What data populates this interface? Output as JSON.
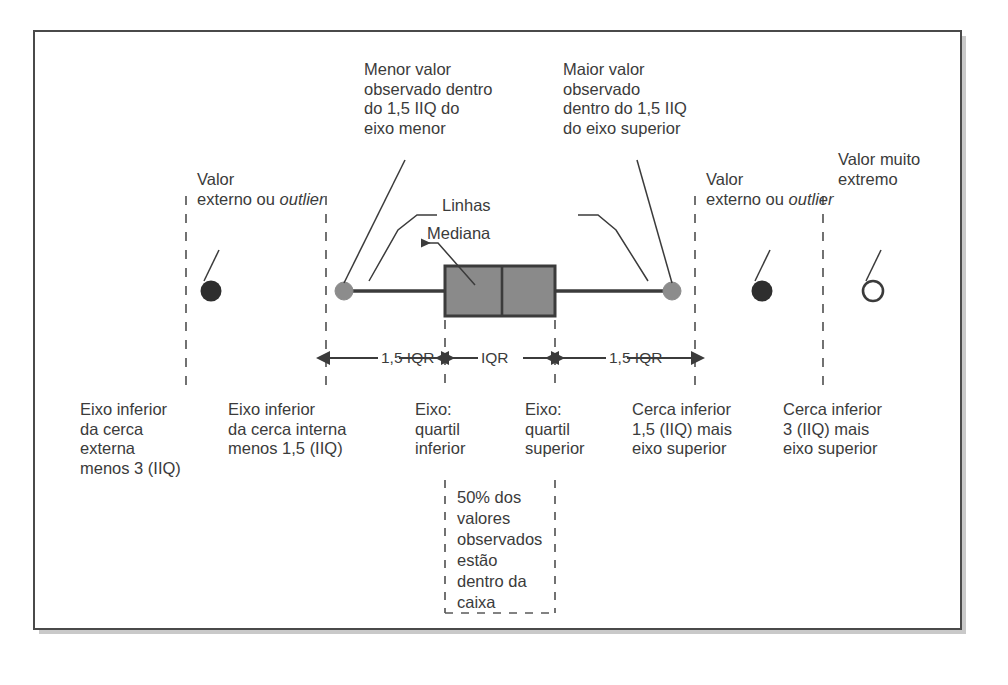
{
  "figure": {
    "type": "boxplot-annotated-diagram",
    "language": "pt-BR",
    "colors": {
      "frame_border": "#4a4a4a",
      "frame_shadow": "#c9c9c9",
      "box_fill": "#8a8a8a",
      "box_stroke": "#3b3b3b",
      "whisker_line": "#3b3b3b",
      "whisker_cap_dot": "#8c8c8c",
      "outlier_fill": "#2e2e2e",
      "extreme_fill": "#ffffff",
      "extreme_stroke": "#3b3b3b",
      "dashed_guide": "#5a5a5a",
      "text": "#3b3b3b"
    }
  },
  "callouts": {
    "lower_whisker": "Menor valor\nobservado dentro\ndo 1,5 IIQ do\neixo menor",
    "upper_whisker": "Maior valor\nobservado\ndentro do 1,5 IIQ\ndo eixo superior",
    "whisker_lines": "Linhas",
    "median": "Mediana",
    "outlier_left": "Valor\nexterno ou\noutlier",
    "outlier_left_plain": "Valor\nexterno ou ",
    "outlier_left_italic": "outlier",
    "outlier_right_plain": "Valor\nexterno ou ",
    "outlier_right_italic": "outlier",
    "extreme_value": "Valor muito\nextremo"
  },
  "dimensions": [
    {
      "id": "left-fence",
      "label": "1,5 IQR"
    },
    {
      "id": "iqr",
      "label": "IQR"
    },
    {
      "id": "right-fence",
      "label": "1,5 IQR"
    }
  ],
  "bottom_labels": [
    {
      "id": "outer-lower-fence",
      "text": "Eixo inferior\nda cerca\nexterna\nmenos 3 (IIQ)"
    },
    {
      "id": "inner-lower-fence",
      "text": "Eixo inferior\nda cerca interna\nmenos 1,5 (IIQ)"
    },
    {
      "id": "lower-quartile",
      "text": "Eixo:\nquartil\ninferior"
    },
    {
      "id": "upper-quartile",
      "text": "Eixo:\nquartil\nsuperior"
    },
    {
      "id": "inner-upper-fence",
      "text": "Cerca inferior\n1,5 (IIQ) mais\neixo superior"
    },
    {
      "id": "outer-upper-fence",
      "text": "Cerca inferior\n3 (IIQ) mais\neixo superior"
    }
  ],
  "box_note": {
    "text": "50% dos\nvalores\nobservados\nestão\ndentro da\ncaixa"
  },
  "geometry": {
    "baseline_y": 291,
    "box_left_x": 445,
    "box_right_x": 555,
    "median_x": 502,
    "whisker_left_x": 344,
    "whisker_right_x": 672,
    "outlier_left_x": 211,
    "outlier_right_x": 762,
    "extreme_x": 873,
    "guides_x": [
      186,
      326,
      445,
      555,
      695,
      823
    ]
  }
}
